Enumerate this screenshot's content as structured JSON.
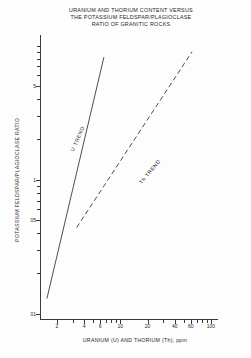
{
  "chart_data": {
    "type": "line",
    "title": "URANIUM AND THORIUM CONTENT VERSUS THE POTASSIUM FELDSPAR/PLAGIOCLASE RATIO OF GRANITIC ROCKS",
    "title_lines": [
      "URANIUM AND THORIUM CONTENT VERSUS",
      "THE POTASSIUM FELDSPAR/PLAGIOCLASE",
      "RATIO OF GRANITIC ROCKS"
    ],
    "xlabel": "URANIUM (U) AND THORIUM (Th), ppm",
    "ylabel": "POTASSIUM FELDSPAR/PLAGIOCLASE RATIO",
    "xscale": "log",
    "yscale": "log",
    "xlim": [
      1.3,
      120
    ],
    "ylim": [
      0.09,
      12
    ],
    "grid": false,
    "legend": "inline-labels",
    "xticks": [
      {
        "value": 2,
        "label": "2",
        "major": true
      },
      {
        "value": 3,
        "label": "",
        "major": false
      },
      {
        "value": 4,
        "label": "4",
        "major": true
      },
      {
        "value": 5,
        "label": "",
        "major": false
      },
      {
        "value": 6,
        "label": "6",
        "major": true
      },
      {
        "value": 7,
        "label": "",
        "major": false
      },
      {
        "value": 8,
        "label": "",
        "major": false
      },
      {
        "value": 9,
        "label": "",
        "major": false
      },
      {
        "value": 10,
        "label": "10",
        "major": true
      },
      {
        "value": 20,
        "label": "20",
        "major": true
      },
      {
        "value": 30,
        "label": "",
        "major": false
      },
      {
        "value": 40,
        "label": "40",
        "major": true
      },
      {
        "value": 50,
        "label": "",
        "major": false
      },
      {
        "value": 60,
        "label": "60",
        "major": true
      },
      {
        "value": 70,
        "label": "",
        "major": false
      },
      {
        "value": 80,
        "label": "",
        "major": false
      },
      {
        "value": 90,
        "label": "",
        "major": false
      },
      {
        "value": 100,
        "label": "100",
        "major": true
      }
    ],
    "yticks": [
      {
        "value": 0.1,
        "label": "01",
        "major": true
      },
      {
        "value": 0.2,
        "label": "",
        "major": false
      },
      {
        "value": 0.3,
        "label": "",
        "major": false
      },
      {
        "value": 0.4,
        "label": "",
        "major": false
      },
      {
        "value": 0.5,
        "label": "05",
        "major": true
      },
      {
        "value": 0.6,
        "label": "",
        "major": false
      },
      {
        "value": 0.7,
        "label": "",
        "major": false
      },
      {
        "value": 0.8,
        "label": "",
        "major": false
      },
      {
        "value": 0.9,
        "label": "",
        "major": false
      },
      {
        "value": 1,
        "label": "1",
        "major": true
      },
      {
        "value": 2,
        "label": "",
        "major": false
      },
      {
        "value": 3,
        "label": "",
        "major": false
      },
      {
        "value": 4,
        "label": "",
        "major": false
      },
      {
        "value": 5,
        "label": "5",
        "major": true
      },
      {
        "value": 6,
        "label": "",
        "major": false
      },
      {
        "value": 7,
        "label": "",
        "major": false
      },
      {
        "value": 8,
        "label": "",
        "major": false
      },
      {
        "value": 9,
        "label": "",
        "major": false
      },
      {
        "value": 10,
        "label": "",
        "major": false
      }
    ],
    "series": [
      {
        "name": "U TREND",
        "label": "U TREND",
        "style": "solid",
        "color": "#3a3a3a",
        "points": [
          [
            1.55,
            0.13
          ],
          [
            6.6,
            8.2
          ]
        ]
      },
      {
        "name": "Th TREND",
        "label": "Th TREND",
        "style": "dashed",
        "color": "#3a3a3a",
        "points": [
          [
            3.3,
            0.44
          ],
          [
            62,
            9.0
          ]
        ]
      }
    ]
  }
}
